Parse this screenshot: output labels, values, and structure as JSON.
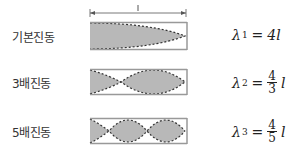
{
  "diagram": {
    "length_label": "l",
    "rows": [
      {
        "label": "기본진동",
        "symbol": "λ",
        "sub": "1",
        "eq": "=",
        "value": "4l",
        "num": "",
        "den": "",
        "var": ""
      },
      {
        "label": "3배진동",
        "symbol": "λ",
        "sub": "2",
        "eq": "=",
        "value": "",
        "num": "4",
        "den": "3",
        "var": "l"
      },
      {
        "label": "5배진동",
        "symbol": "λ",
        "sub": "3",
        "eq": "=",
        "value": "",
        "num": "4",
        "den": "5",
        "var": "l"
      }
    ],
    "colors": {
      "fill": "#b8b8b8",
      "border": "#999999",
      "dash": "#333333"
    }
  }
}
